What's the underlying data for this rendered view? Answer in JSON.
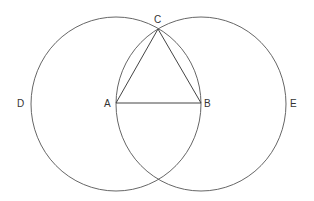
{
  "diagram": {
    "stroke_color": "#555555",
    "points": {
      "A": {
        "label": "A",
        "x": 116,
        "y": 103
      },
      "B": {
        "label": "B",
        "x": 201,
        "y": 103
      },
      "C": {
        "label": "C",
        "x": 158,
        "y": 29
      }
    },
    "circles": [
      {
        "name": "circle-centered-A",
        "cx": 116,
        "cy": 104,
        "rx": 85,
        "ry": 87,
        "arc_label": "D"
      },
      {
        "name": "circle-centered-B",
        "cx": 201,
        "cy": 104,
        "rx": 85,
        "ry": 87,
        "arc_label": "E"
      }
    ],
    "segments": [
      "AB",
      "AC",
      "BC"
    ],
    "labels": {
      "A": "A",
      "B": "B",
      "C": "C",
      "D": "D",
      "E": "E"
    }
  }
}
